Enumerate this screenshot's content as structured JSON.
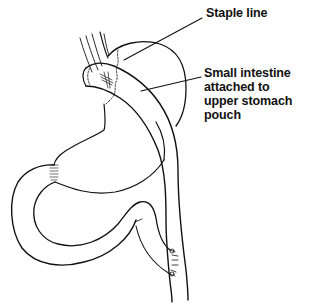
{
  "diagram": {
    "labels": [
      {
        "id": "staple-line",
        "lines": [
          "Staple line"
        ]
      },
      {
        "id": "small-intestine",
        "lines": [
          "Small intestine",
          "attached to",
          "upper stomach",
          "pouch"
        ]
      }
    ],
    "colors": {
      "line": "#111111",
      "background": "#ffffff"
    }
  }
}
